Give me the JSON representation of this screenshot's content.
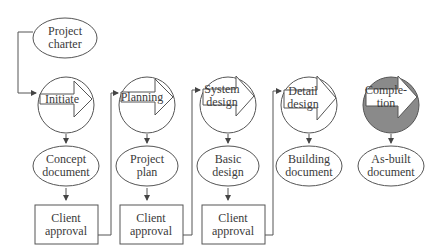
{
  "diagram": {
    "start": {
      "label_line1": "Project",
      "label_line2": "charter"
    },
    "phases": [
      {
        "label_line1": "Initiate",
        "label_line2": "",
        "shaded": false
      },
      {
        "label_line1": "Planning",
        "label_line2": "",
        "shaded": false
      },
      {
        "label_line1": "System",
        "label_line2": "design",
        "shaded": false
      },
      {
        "label_line1": "Detail",
        "label_line2": "design",
        "shaded": false
      },
      {
        "label_line1": "Comple-",
        "label_line2": "tion",
        "shaded": true
      }
    ],
    "deliverables": [
      {
        "label_line1": "Concept",
        "label_line2": "document"
      },
      {
        "label_line1": "Project",
        "label_line2": "plan"
      },
      {
        "label_line1": "Basic",
        "label_line2": "design"
      },
      {
        "label_line1": "Building",
        "label_line2": "document"
      },
      {
        "label_line1": "As-built",
        "label_line2": "document"
      }
    ],
    "approvals": [
      {
        "label_line1": "Client",
        "label_line2": "approval"
      },
      {
        "label_line1": "Client",
        "label_line2": "approval"
      },
      {
        "label_line1": "Client",
        "label_line2": "approval"
      }
    ],
    "colors": {
      "stroke": "#555555",
      "shade": "#8a8a8a",
      "text": "#3a3a3a"
    }
  }
}
